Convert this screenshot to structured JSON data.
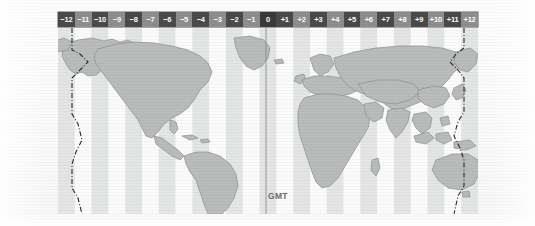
{
  "figure": {
    "gmt_label": "GMT",
    "prime_meridian_label": "GMT"
  },
  "scalebar": {
    "name": "utc-offset-scale",
    "zones": [
      {
        "label": "−12",
        "offset": -12,
        "shade": "dark"
      },
      {
        "label": "−11",
        "offset": -11,
        "shade": "light"
      },
      {
        "label": "−10",
        "offset": -10,
        "shade": "dark"
      },
      {
        "label": "−9",
        "offset": -9,
        "shade": "light"
      },
      {
        "label": "−8",
        "offset": -8,
        "shade": "dark"
      },
      {
        "label": "−7",
        "offset": -7,
        "shade": "light"
      },
      {
        "label": "−6",
        "offset": -6,
        "shade": "dark"
      },
      {
        "label": "−5",
        "offset": -5,
        "shade": "light"
      },
      {
        "label": "−4",
        "offset": -4,
        "shade": "dark"
      },
      {
        "label": "−3",
        "offset": -3,
        "shade": "light"
      },
      {
        "label": "−2",
        "offset": -2,
        "shade": "dark"
      },
      {
        "label": "−1",
        "offset": -1,
        "shade": "light"
      },
      {
        "label": "0",
        "offset": 0,
        "shade": "gmt"
      },
      {
        "label": "+1",
        "offset": 1,
        "shade": "dark"
      },
      {
        "label": "+2",
        "offset": 2,
        "shade": "light"
      },
      {
        "label": "+3",
        "offset": 3,
        "shade": "dark"
      },
      {
        "label": "+4",
        "offset": 4,
        "shade": "light"
      },
      {
        "label": "+5",
        "offset": 5,
        "shade": "dark"
      },
      {
        "label": "+6",
        "offset": 6,
        "shade": "light"
      },
      {
        "label": "+7",
        "offset": 7,
        "shade": "dark"
      },
      {
        "label": "+8",
        "offset": 8,
        "shade": "light"
      },
      {
        "label": "+9",
        "offset": 9,
        "shade": "dark"
      },
      {
        "label": "+10",
        "offset": 10,
        "shade": "light"
      },
      {
        "label": "+11",
        "offset": 11,
        "shade": "dark"
      },
      {
        "label": "+12",
        "offset": 12,
        "shade": "light"
      }
    ]
  },
  "map": {
    "name": "world-time-zone-map",
    "projection": "equirectangular",
    "longitude_range": [
      -180,
      180
    ],
    "zone_band_count": 25,
    "band_colors": {
      "odd": "#e4e6e6",
      "even": "#fbfbfb"
    },
    "land_color": "#b9bcbb",
    "land_outline": "#8d9190",
    "ocean_color": "#f4f5f5",
    "date_line_color": "#2b2b2b",
    "prime_meridian_color": "#8a8c8c",
    "features": [
      "international-date-line-west",
      "international-date-line-east",
      "prime-meridian",
      "north-america",
      "south-america",
      "greenland",
      "europe",
      "africa",
      "asia",
      "australia",
      "antarctica-edge"
    ]
  },
  "colors": {
    "scalebar_dark": "#4a4a4a",
    "scalebar_light": "#8e8e8e",
    "scalebar_gmt": "#3a3a3a",
    "scalebar_text": "#ffffff",
    "gmt_text": "#6b6b6b",
    "page_background": "#ffffff"
  }
}
